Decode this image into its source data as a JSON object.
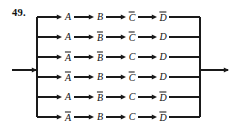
{
  "figure": {
    "problem_number": "49."
  },
  "diagram": {
    "input_arrow": {
      "name": "input-arrow"
    },
    "output_arrow": {
      "name": "output-arrow"
    },
    "left_bus": {
      "name": "input-bus-line"
    },
    "right_bus": {
      "name": "output-bus-line"
    },
    "column_count": 4,
    "row_count": 6,
    "rows": [
      {
        "index": 1,
        "literals": [
          {
            "letter": "A",
            "negated": false
          },
          {
            "letter": "B",
            "negated": false
          },
          {
            "letter": "C",
            "negated": true
          },
          {
            "letter": "D",
            "negated": true
          }
        ]
      },
      {
        "index": 2,
        "literals": [
          {
            "letter": "A",
            "negated": false
          },
          {
            "letter": "B",
            "negated": true
          },
          {
            "letter": "C",
            "negated": true
          },
          {
            "letter": "D",
            "negated": false
          }
        ]
      },
      {
        "index": 3,
        "literals": [
          {
            "letter": "A",
            "negated": true
          },
          {
            "letter": "B",
            "negated": true
          },
          {
            "letter": "C",
            "negated": false
          },
          {
            "letter": "D",
            "negated": false
          }
        ]
      },
      {
        "index": 4,
        "literals": [
          {
            "letter": "A",
            "negated": true
          },
          {
            "letter": "B",
            "negated": false
          },
          {
            "letter": "C",
            "negated": true
          },
          {
            "letter": "D",
            "negated": false
          }
        ]
      },
      {
        "index": 5,
        "literals": [
          {
            "letter": "A",
            "negated": false
          },
          {
            "letter": "B",
            "negated": true
          },
          {
            "letter": "C",
            "negated": false
          },
          {
            "letter": "D",
            "negated": true
          }
        ]
      },
      {
        "index": 6,
        "literals": [
          {
            "letter": "A",
            "negated": true
          },
          {
            "letter": "B",
            "negated": false
          },
          {
            "letter": "C",
            "negated": false
          },
          {
            "letter": "D",
            "negated": true
          }
        ]
      }
    ]
  },
  "geometry": {
    "row_y": [
      17,
      37,
      57,
      77,
      97,
      117
    ],
    "col_x": [
      68,
      100,
      132,
      163
    ],
    "left_bus_x": 37,
    "right_bus_x": 200,
    "input_arrow_y": 70,
    "output_arrow_y": 70,
    "input_arrow_x_start": 12,
    "output_arrow_x_end": 229
  },
  "colors": {
    "line": "#1a1a1a",
    "text": "#111111",
    "background": "#ffffff"
  }
}
